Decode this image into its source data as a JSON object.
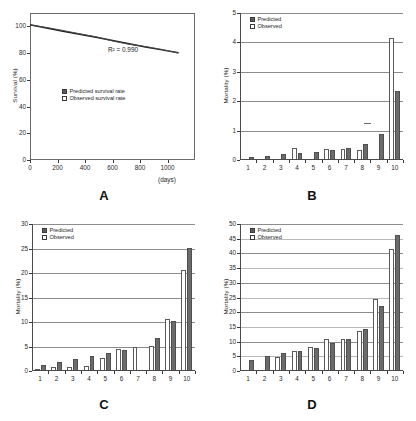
{
  "figure": {
    "panels": [
      "A",
      "B",
      "C",
      "D"
    ]
  },
  "chart_data": [
    {
      "panel": "A",
      "type": "line",
      "title": "",
      "xlabel": "(days)",
      "ylabel": "Survival (%)",
      "xlim": [
        0,
        1200
      ],
      "ylim": [
        0,
        110
      ],
      "xticks": [
        0,
        200,
        400,
        600,
        800,
        1000
      ],
      "yticks": [
        0,
        20,
        40,
        60,
        80,
        100
      ],
      "grid": false,
      "annotation": "R² = 0.990",
      "legend_position": "inside-left",
      "series": [
        {
          "name": "Predicted survival rate",
          "marker": "filled-square",
          "x": [
            0,
            120,
            240,
            360,
            480,
            600,
            720,
            840,
            960,
            1080
          ],
          "y": [
            101.2,
            98.8,
            96.4,
            94.1,
            91.8,
            89.4,
            87.0,
            84.6,
            82.4,
            80.3
          ]
        },
        {
          "name": "Observed survival rate",
          "marker": "open-square",
          "x": [
            0,
            120,
            240,
            360,
            480,
            600,
            720,
            840,
            960,
            1080
          ],
          "y": [
            101.0,
            99.2,
            96.9,
            94.5,
            92.2,
            89.1,
            86.6,
            84.9,
            82.7,
            80.0
          ]
        }
      ]
    },
    {
      "panel": "B",
      "type": "bar",
      "title": "",
      "xlabel": "",
      "ylabel": "Mortality (%)",
      "ylim": [
        0,
        5
      ],
      "yticks": [
        0,
        1,
        2,
        3,
        4,
        5
      ],
      "categories": [
        "1",
        "2",
        "3",
        "4",
        "5",
        "6",
        "7",
        "8",
        "9",
        "10"
      ],
      "grid": true,
      "legend_position": "top-left",
      "series": [
        {
          "name": "Observed",
          "values": [
            0.0,
            0.0,
            0.0,
            0.42,
            0.0,
            0.38,
            0.37,
            0.35,
            0.0,
            4.15
          ]
        },
        {
          "name": "Predicted",
          "values": [
            0.09,
            0.12,
            0.19,
            0.24,
            0.26,
            0.34,
            0.4,
            0.54,
            0.9,
            2.35
          ]
        }
      ]
    },
    {
      "panel": "C",
      "type": "bar",
      "title": "",
      "xlabel": "",
      "ylabel": "Mortality (%)",
      "ylim": [
        0,
        30
      ],
      "yticks": [
        0,
        5,
        10,
        15,
        20,
        25,
        30
      ],
      "categories": [
        "1",
        "2",
        "3",
        "4",
        "5",
        "6",
        "7",
        "8",
        "9",
        "10"
      ],
      "grid": true,
      "legend_position": "top-left",
      "series": [
        {
          "name": "Observed",
          "values": [
            0.4,
            0.9,
            0.9,
            1.1,
            2.6,
            4.5,
            5.0,
            5.1,
            10.7,
            20.7
          ]
        },
        {
          "name": "Predicted",
          "values": [
            1.2,
            1.8,
            2.5,
            3.0,
            3.6,
            4.2,
            0.0,
            6.8,
            10.3,
            25.2
          ]
        }
      ]
    },
    {
      "panel": "D",
      "type": "bar",
      "title": "",
      "xlabel": "",
      "ylabel": "Mortality (%)",
      "ylim": [
        0,
        50
      ],
      "yticks": [
        0,
        5,
        10,
        15,
        20,
        25,
        30,
        35,
        40,
        45,
        50
      ],
      "categories": [
        "1",
        "2",
        "3",
        "4",
        "5",
        "6",
        "7",
        "8",
        "9",
        "10"
      ],
      "grid": true,
      "legend_position": "top-left",
      "series": [
        {
          "name": "Observed",
          "values": [
            0.0,
            0.0,
            4.6,
            6.8,
            8.2,
            11.0,
            11.0,
            13.7,
            24.6,
            41.6
          ]
        },
        {
          "name": "Predicted",
          "values": [
            3.9,
            5.2,
            6.1,
            6.9,
            7.9,
            9.4,
            11.0,
            14.2,
            22.2,
            46.2
          ]
        }
      ]
    }
  ],
  "legend": {
    "predicted": "Predicted",
    "observed": "Observed"
  },
  "panel_a": {
    "legend_predicted": "Predicted survival rate",
    "legend_observed": "Observed survival rate",
    "r_squared": "R² = 0.990",
    "ylabel": "Survival (%)",
    "xlabel": "(days)",
    "xticks": [
      "0",
      "200",
      "400",
      "600",
      "800",
      "1000"
    ],
    "yticks": [
      "0",
      "20",
      "40",
      "60",
      "80",
      "100"
    ],
    "letter": "A"
  },
  "panel_b": {
    "ylabel": "Mortality (%)",
    "yticks": [
      "0",
      "1",
      "2",
      "3",
      "4",
      "5"
    ],
    "xticks": [
      "1",
      "2",
      "3",
      "4",
      "5",
      "6",
      "7",
      "8",
      "9",
      "10"
    ],
    "letter": "B"
  },
  "panel_c": {
    "ylabel": "Mortality (%)",
    "yticks": [
      "0",
      "5",
      "10",
      "15",
      "20",
      "25",
      "30"
    ],
    "xticks": [
      "1",
      "2",
      "3",
      "4",
      "5",
      "6",
      "7",
      "8",
      "9",
      "10"
    ],
    "letter": "C"
  },
  "panel_d": {
    "ylabel": "Mortality (%)",
    "yticks": [
      "0",
      "5",
      "10",
      "15",
      "20",
      "25",
      "30",
      "35",
      "40",
      "45",
      "50"
    ],
    "xticks": [
      "1",
      "2",
      "3",
      "4",
      "5",
      "6",
      "7",
      "8",
      "9",
      "10"
    ],
    "letter": "D"
  }
}
